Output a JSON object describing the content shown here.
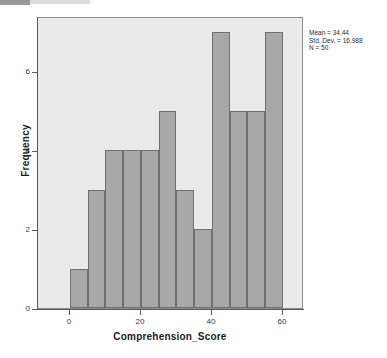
{
  "chart_data": {
    "type": "bar",
    "title": "",
    "subtitle": "",
    "xlabel": "Comprehension_Score",
    "ylabel": "Frequency",
    "xlim": [
      -9,
      66
    ],
    "ylim": [
      0,
      7.4
    ],
    "grid": false,
    "legend": null,
    "bin_width": 5,
    "categories": [
      "0-5",
      "5-10",
      "10-15",
      "15-20",
      "20-25",
      "25-30",
      "30-35",
      "35-40",
      "40-45",
      "45-50",
      "50-55",
      "55-60"
    ],
    "bin_starts": [
      0,
      5,
      10,
      15,
      20,
      25,
      30,
      35,
      40,
      45,
      50,
      55
    ],
    "values": [
      1,
      3,
      4,
      4,
      4,
      5,
      3,
      2,
      7,
      5,
      5,
      7
    ],
    "xticks": [
      0,
      20,
      40,
      60
    ],
    "xtick_labels": [
      "0",
      "20",
      "40",
      "60"
    ],
    "yticks": [
      0,
      2,
      4,
      6
    ],
    "ytick_labels": [
      "0",
      "2",
      "4",
      "6"
    ],
    "annotations": {
      "mean": "Mean = 34.44",
      "std_dev": "Std. Dev. = 16.988",
      "n": "N = 50"
    },
    "colors": {
      "bar_fill": "#a8a8a8",
      "bar_border": "#6f6f6f",
      "plot_background": "#eaeaea",
      "frame_border": "#8d8d8d",
      "axis_line": "#5a5a5a",
      "text": "#1c1c1c",
      "page_background": "#ffffff"
    }
  }
}
